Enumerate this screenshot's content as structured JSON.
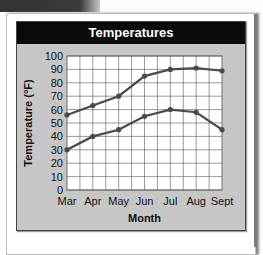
{
  "chart_data": {
    "type": "line",
    "title": "Temperatures",
    "xlabel": "Month",
    "ylabel": "Temperature (°F)",
    "categories": [
      "Mar",
      "Apr",
      "May",
      "Jun",
      "Jul",
      "Aug",
      "Sept"
    ],
    "ylim": [
      0,
      100
    ],
    "yticks": [
      0,
      10,
      20,
      30,
      40,
      50,
      60,
      70,
      80,
      90,
      100
    ],
    "grid": true,
    "legend": "none",
    "series": [
      {
        "name": "High",
        "values": [
          56,
          63,
          70,
          85,
          90,
          91,
          89
        ]
      },
      {
        "name": "Low",
        "values": [
          30,
          40,
          45,
          55,
          60,
          58,
          45
        ]
      }
    ]
  },
  "colors": {
    "line": "#4a4a4a",
    "panel": "#c6c6c6",
    "titlebar": "#0a0a0a",
    "plot": "#ffffff"
  }
}
